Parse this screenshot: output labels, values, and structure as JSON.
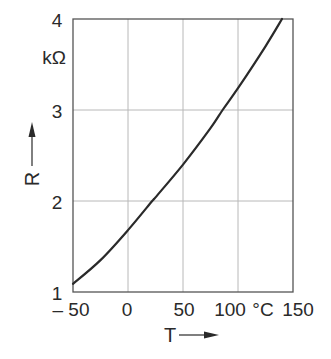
{
  "chart_data": {
    "type": "line",
    "title": "",
    "xlabel": "T",
    "ylabel": "R",
    "x_unit": "°C",
    "y_unit": "kΩ",
    "xlim": [
      -50,
      150
    ],
    "ylim": [
      1,
      4
    ],
    "grid": true,
    "legend": null,
    "x_ticks": [
      -50,
      0,
      50,
      100,
      150
    ],
    "x_tick_labels": [
      "– 50",
      "0",
      "50",
      "100",
      "150"
    ],
    "y_ticks": [
      1,
      2,
      3,
      4
    ],
    "y_tick_labels": [
      "1",
      "2",
      "3",
      "4"
    ],
    "series": [
      {
        "name": "R(T)",
        "color": "#2a2a2a",
        "x": [
          -50,
          -25,
          0,
          22,
          25,
          50,
          75,
          86,
          100,
          125,
          140
        ],
        "y": [
          1.09,
          1.35,
          1.68,
          2.0,
          2.04,
          2.4,
          2.8,
          3.0,
          3.24,
          3.7,
          4.0
        ]
      }
    ]
  },
  "labels": {
    "y_unit": "kΩ",
    "x_unit": "°C",
    "y_axis": "R",
    "x_axis": "T",
    "y_ticks": [
      "1",
      "2",
      "3",
      "4"
    ],
    "x_ticks": [
      "– 50",
      "0",
      "50",
      "100",
      "150"
    ]
  },
  "colors": {
    "frame": "#555555",
    "grid": "#b8b8b8",
    "curve": "#2a2a2a",
    "text": "#2a2a2a"
  }
}
